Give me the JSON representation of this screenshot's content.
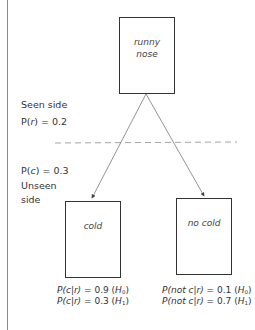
{
  "diagram": {
    "top_node": {
      "label_line1": "runny",
      "label_line2": "nose"
    },
    "seen_side": {
      "label": "Seen side",
      "prob_prefix": "P(",
      "prob_var": "r",
      "prob_suffix": ") = 0.2"
    },
    "unseen_side": {
      "prob_prefix": "P(",
      "prob_var": "c",
      "prob_suffix": ") = 0.3",
      "label_line1": "Unseen",
      "label_line2": "side"
    },
    "left_node": {
      "label": "cold",
      "eq1": {
        "lhs": "P(c|r)",
        "rhs": " = 0.9 (",
        "hyp": "H",
        "sub": "0",
        "close": ")"
      },
      "eq2": {
        "lhs": "P(c|r)",
        "rhs": " = 0.3 (",
        "hyp": "H",
        "sub": "1",
        "close": ")"
      }
    },
    "right_node": {
      "label": "no cold",
      "eq1": {
        "lhs": "P(not c|r)",
        "rhs": " = 0.1 (",
        "hyp": "H",
        "sub": "0",
        "close": ")"
      },
      "eq2": {
        "lhs": "P(not c|r)",
        "rhs": " = 0.7 (",
        "hyp": "H",
        "sub": "1",
        "close": ")"
      }
    },
    "colors": {
      "line": "#555555",
      "dash": "#9a9a9a",
      "border": "#333333"
    }
  }
}
